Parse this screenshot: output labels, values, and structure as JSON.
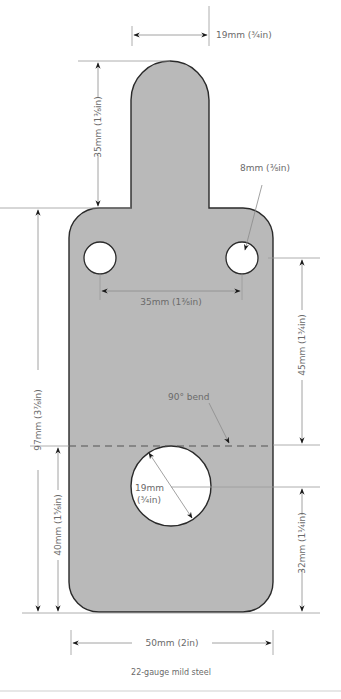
{
  "diagram": {
    "type": "technical-drawing",
    "colors": {
      "plate_fill": "#b9b9b9",
      "plate_stroke": "#2a2a2a",
      "hole_fill": "#ffffff",
      "dimension_line": "#9a9a9a",
      "arrow": "#1a1a1a",
      "label": "#6a6a6a"
    },
    "dimensions": {
      "tab_width": "19mm (¾in)",
      "tab_height": "35mm (1⅜in)",
      "small_hole_diameter": "8mm (⅜in)",
      "hole_spacing": "35mm (1⅜in)",
      "overall_height": "97mm (3⅞in)",
      "hole_to_bend": "45mm (1¾in)",
      "bend_label": "90° bend",
      "large_hole_diameter_line1": "19mm",
      "large_hole_diameter_line2": "(¾in)",
      "bend_to_bottom": "40mm (1⅝in)",
      "large_hole_to_bottom": "32mm (1¼in)",
      "overall_width": "50mm (2in)"
    },
    "caption": "22-gauge mild steel"
  }
}
